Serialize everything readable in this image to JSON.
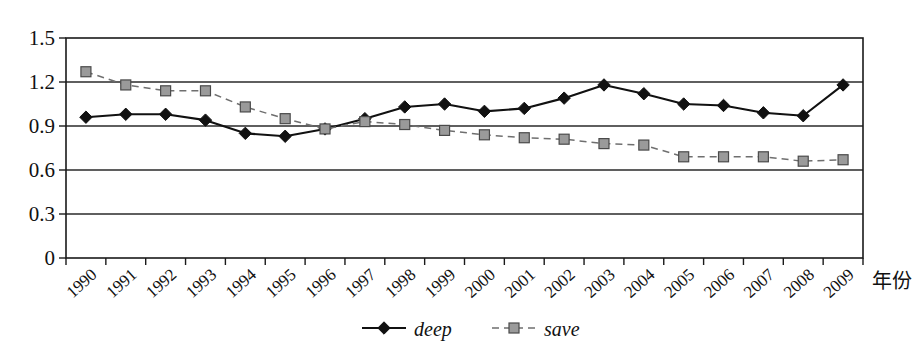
{
  "chart_data": {
    "type": "line",
    "title": "",
    "xlabel": "年份",
    "ylabel": "",
    "ylim": [
      0,
      1.5
    ],
    "yticks": [
      "0",
      "0.3",
      "0.6",
      "0.9",
      "1.2",
      "1.5"
    ],
    "ytick_values": [
      0,
      0.3,
      0.6,
      0.9,
      1.2,
      1.5
    ],
    "grid": true,
    "legend_position": "bottom-center",
    "categories": [
      "1990",
      "1991",
      "1992",
      "1993",
      "1994",
      "1995",
      "1996",
      "1997",
      "1998",
      "1999",
      "2000",
      "2001",
      "2002",
      "2003",
      "2004",
      "2005",
      "2006",
      "2007",
      "2008",
      "2009"
    ],
    "series": [
      {
        "name": "deep",
        "marker": "filled-diamond",
        "linestyle": "solid",
        "color": "#111111",
        "values": [
          0.96,
          0.98,
          0.98,
          0.94,
          0.85,
          0.83,
          0.88,
          0.95,
          1.03,
          1.05,
          1.0,
          1.02,
          1.09,
          1.18,
          1.12,
          1.05,
          1.04,
          0.99,
          0.97,
          1.18
        ]
      },
      {
        "name": "save",
        "marker": "square",
        "linestyle": "dashed",
        "color": "#9a9a9a",
        "values": [
          1.27,
          1.18,
          1.14,
          1.14,
          1.03,
          0.95,
          0.88,
          0.93,
          0.91,
          0.87,
          0.84,
          0.82,
          0.81,
          0.78,
          0.77,
          0.69,
          0.69,
          0.69,
          0.66,
          0.67
        ]
      }
    ]
  },
  "legend": {
    "items": [
      {
        "label": "deep"
      },
      {
        "label": "save"
      }
    ]
  },
  "axis": {
    "x_title": "年份"
  }
}
